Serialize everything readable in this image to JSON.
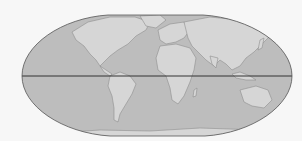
{
  "map": {
    "projection": "flat-polar pseudocylindrical",
    "style": "grayscale",
    "colors": {
      "background": "#f7f7f7",
      "ocean": "#bdbdbd",
      "land": "#d6d6d6",
      "coast": "#8f8f8f",
      "outline": "#555555",
      "equator": "#333333"
    },
    "features": [
      "equator-line",
      "continents",
      "map-outline"
    ]
  }
}
